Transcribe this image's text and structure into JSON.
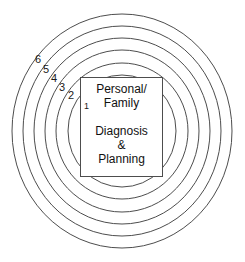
{
  "figure": {
    "type": "concentric-ring-diagram",
    "background_color": "#ffffff",
    "stroke_color": "#4d4d4d",
    "text_color": "#1a1a1a"
  },
  "center_box": {
    "lines_top": [
      "Personal/",
      "Family"
    ],
    "lines_bottom": [
      "Diagnosis",
      "&",
      "Planning"
    ]
  },
  "ring_labels": [
    {
      "label": "6",
      "ring": 6
    },
    {
      "label": "5",
      "ring": 5
    },
    {
      "label": "4",
      "ring": 4
    },
    {
      "label": "3",
      "ring": 3
    },
    {
      "label": "2",
      "ring": 2
    },
    {
      "label": "1",
      "ring": 1
    }
  ]
}
